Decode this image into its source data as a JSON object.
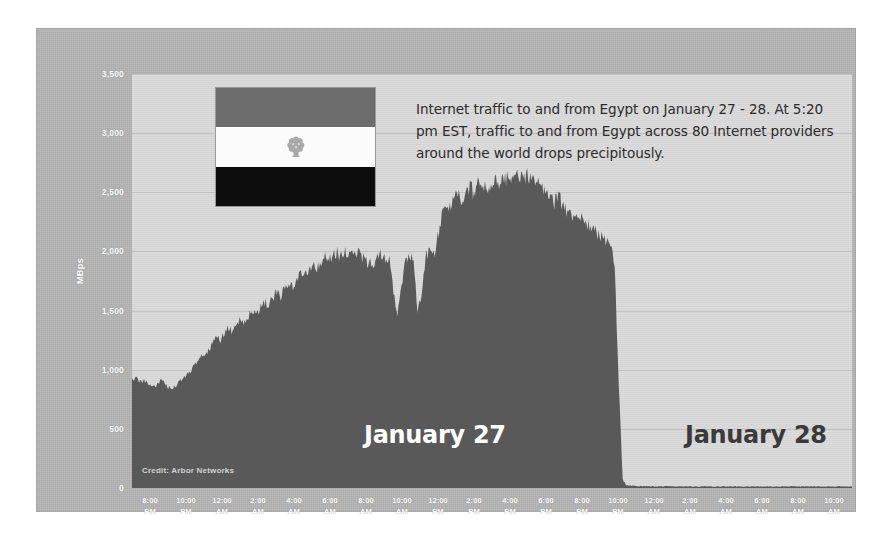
{
  "chart_data": {
    "type": "area",
    "title": "",
    "xlabel": "",
    "ylabel": "MBps",
    "ylim": [
      0,
      3500
    ],
    "ytick_labels": [
      "3,500",
      "3,000",
      "2,500",
      "2,000",
      "1,500",
      "1,000",
      "500",
      "0"
    ],
    "ytick_values": [
      3500,
      3000,
      2500,
      2000,
      1500,
      1000,
      500,
      0
    ],
    "grid": true,
    "legend": "none",
    "xtick_labels": [
      "8:00\nPM",
      "10:00\nPM",
      "12:00\nAM",
      "2:00\nAM",
      "4:00\nAM",
      "6:00\nAM",
      "8:00\nAM",
      "10:00\nAM",
      "12:00\nPM",
      "2:00\nPM",
      "4:00\nPM",
      "6:00\nPM",
      "8:00\nPM",
      "10:00\nPM",
      "12:00\nAM",
      "2:00\nAM",
      "4:00\nAM",
      "6:00\nAM",
      "8:00\nAM",
      "10:00\nAM"
    ],
    "xticks": [
      {
        "time": "8:00",
        "meridiem": "PM"
      },
      {
        "time": "10:00",
        "meridiem": "PM"
      },
      {
        "time": "12:00",
        "meridiem": "AM"
      },
      {
        "time": "2:00",
        "meridiem": "AM"
      },
      {
        "time": "4:00",
        "meridiem": "AM"
      },
      {
        "time": "6:00",
        "meridiem": "AM"
      },
      {
        "time": "8:00",
        "meridiem": "AM"
      },
      {
        "time": "10:00",
        "meridiem": "AM"
      },
      {
        "time": "12:00",
        "meridiem": "PM"
      },
      {
        "time": "2:00",
        "meridiem": "PM"
      },
      {
        "time": "4:00",
        "meridiem": "PM"
      },
      {
        "time": "6:00",
        "meridiem": "PM"
      },
      {
        "time": "8:00",
        "meridiem": "PM"
      },
      {
        "time": "10:00",
        "meridiem": "PM"
      },
      {
        "time": "12:00",
        "meridiem": "AM"
      },
      {
        "time": "2:00",
        "meridiem": "AM"
      },
      {
        "time": "4:00",
        "meridiem": "AM"
      },
      {
        "time": "6:00",
        "meridiem": "AM"
      },
      {
        "time": "8:00",
        "meridiem": "AM"
      },
      {
        "time": "10:00",
        "meridiem": "AM"
      }
    ],
    "series": [
      {
        "name": "Internet traffic to and from Egypt",
        "color": "#595959",
        "values": [
          900,
          940,
          880,
          905,
          870,
          860,
          845,
          905,
          880,
          840,
          830,
          860,
          900,
          930,
          965,
          1010,
          1065,
          1120,
          1100,
          1160,
          1220,
          1270,
          1240,
          1300,
          1345,
          1310,
          1380,
          1420,
          1390,
          1450,
          1480,
          1440,
          1510,
          1560,
          1530,
          1590,
          1640,
          1610,
          1680,
          1720,
          1700,
          1760,
          1810,
          1790,
          1850,
          1880,
          1855,
          1900,
          1930,
          1905,
          1950,
          1975,
          1940,
          1985,
          1960,
          1930,
          1970,
          1945,
          1900,
          1870,
          1890,
          1920,
          1960,
          1930,
          1900,
          1640,
          1480,
          1700,
          1930,
          1960,
          1900,
          1500,
          1600,
          1940,
          1975,
          1950,
          2100,
          2280,
          2400,
          2340,
          2430,
          2480,
          2420,
          2500,
          2530,
          2470,
          2540,
          2560,
          2500,
          2550,
          2580,
          2520,
          2570,
          2600,
          2620,
          2610,
          2615,
          2620,
          2610,
          2615,
          2600,
          2570,
          2520,
          2480,
          2420,
          2390,
          2440,
          2380,
          2330,
          2300,
          2270,
          2290,
          2250,
          2220,
          2180,
          2150,
          2120,
          2090,
          2060,
          2030,
          1850,
          900,
          60,
          25,
          20,
          18,
          16,
          15,
          14,
          14,
          13,
          13,
          12,
          14,
          13,
          12,
          13,
          12,
          12,
          13,
          12,
          12,
          13,
          12,
          12,
          11,
          12,
          13,
          12,
          12,
          13,
          12,
          12,
          13,
          12,
          12,
          12,
          13,
          12,
          12,
          13,
          12,
          12,
          13,
          14,
          13,
          13,
          14,
          13,
          12,
          13,
          12,
          13,
          13,
          12,
          13,
          12,
          12,
          13,
          12
        ]
      }
    ],
    "annotations": [
      {
        "name": "shutdown-annotation",
        "text": "Internet traffic to and from Egypt on January 27 - 28. At 5:20 pm EST, traffic to and from Egypt across 80 Internet providers around the world  drops precipitously."
      },
      {
        "name": "day-label-27",
        "text": "January 27"
      },
      {
        "name": "day-label-28",
        "text": "January 28"
      }
    ],
    "credit": "Credit: Arbor Networks"
  },
  "annotation": {
    "text": "Internet traffic to and from Egypt on January 27 - 28. At 5:20 pm EST, traffic to and from Egypt across 80 Internet providers around the world  drops precipitously."
  },
  "days": {
    "first": "January 27",
    "second": "January 28"
  },
  "credit": {
    "text": "Credit: Arbor Networks"
  },
  "axis": {
    "y_label": "MBps"
  },
  "flag": {
    "name": "egypt-flag",
    "alt": "Flag of Egypt"
  },
  "colors": {
    "panel_background": "#b4b4b4",
    "plot_background": "#d9d9d9",
    "series_fill": "#595959",
    "gridline": "#c2c2c2",
    "tick_text": "#ffffff",
    "annotation_text": "#2b2b2b",
    "day27_text": "#ffffff",
    "day28_text": "#3a3a3a"
  }
}
